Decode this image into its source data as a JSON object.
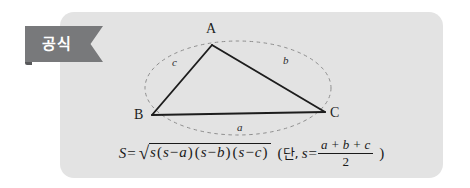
{
  "card": {
    "background_color": "#e3e3e3"
  },
  "banner": {
    "label": "공식",
    "background_color": "#78797b",
    "fold_color": "#58595b",
    "text_color": "#ffffff"
  },
  "figure": {
    "type": "triangle-with-circumscribed-arc",
    "stroke_color": "#1d1d1d",
    "dashed_color": "#8e8e8e",
    "vertices": [
      {
        "name": "A",
        "label": "A",
        "x": 212,
        "y": 45
      },
      {
        "name": "B",
        "label": "B",
        "x": 152,
        "y": 115
      },
      {
        "name": "C",
        "label": "C",
        "x": 325,
        "y": 112
      }
    ],
    "sides": [
      {
        "name": "a",
        "label": "a",
        "between": "BC",
        "label_x": 240,
        "label_y": 127
      },
      {
        "name": "b",
        "label": "b",
        "between": "AC",
        "label_x": 286,
        "label_y": 60
      },
      {
        "name": "c",
        "label": "c",
        "between": "AB",
        "label_x": 176,
        "label_y": 62
      }
    ],
    "arc": {
      "center_x": 238,
      "center_y": 88,
      "radius_x": 93,
      "radius_y": 47,
      "dashed": true
    }
  },
  "formula": {
    "area_symbol": "S",
    "equals": "=",
    "radical_sign": "√",
    "radicand": "s(s-a)(s-b)(s-c)",
    "condition_open": "(",
    "condition_word": "단,",
    "condition_symbol": "s",
    "condition_equals": "=",
    "numerator": "a + b + c",
    "denominator": "2",
    "condition_close": ")",
    "plain_text": "S = √(s(s-a)(s-b)(s-c))  (단, s = (a+b+c)/2 )",
    "tokens": {
      "s_var": "s",
      "open_paren": "(",
      "close_paren": ")",
      "minus": "−",
      "a": "a",
      "b": "b",
      "c": "c",
      "plus": "+"
    }
  }
}
